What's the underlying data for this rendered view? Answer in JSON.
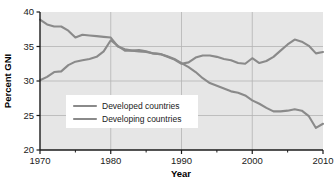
{
  "chart_data": {
    "type": "line",
    "title": "",
    "xlabel": "Year",
    "ylabel": "Percent GNI",
    "xlim": [
      1970,
      2010
    ],
    "ylim": [
      20,
      40
    ],
    "xticks": [
      1970,
      1980,
      1990,
      2000,
      2010
    ],
    "xtick_labels": [
      "1970",
      "1980",
      "1990",
      "2000",
      "2010"
    ],
    "xminor_ticks": [
      1975,
      1985,
      1995,
      2005
    ],
    "yticks": [
      20,
      25,
      30,
      35,
      40
    ],
    "ytick_labels": [
      "20",
      "25",
      "30",
      "35",
      "40"
    ],
    "grid": true,
    "grid_axis": "both",
    "legend_position": "center-left-inside",
    "plot_background": "#e6e6e6",
    "line_color": "#8a8a8a",
    "series": [
      {
        "name": "Developed countries",
        "color": "#8a8a8a",
        "x": [
          1970,
          1971,
          1972,
          1973,
          1974,
          1975,
          1976,
          1977,
          1978,
          1979,
          1980,
          1981,
          1982,
          1983,
          1984,
          1985,
          1986,
          1987,
          1988,
          1989,
          1990,
          1991,
          1992,
          1993,
          1994,
          1995,
          1996,
          1997,
          1998,
          1999,
          2000,
          2001,
          2002,
          2003,
          2004,
          2005,
          2006,
          2007,
          2008,
          2009,
          2010
        ],
        "values": [
          30.1,
          30.6,
          31.3,
          31.4,
          32.3,
          32.8,
          33.0,
          33.2,
          33.5,
          34.3,
          35.9,
          35.1,
          34.4,
          34.4,
          34.3,
          34.2,
          34.0,
          33.9,
          33.6,
          33.2,
          32.6,
          32.0,
          31.3,
          30.4,
          29.7,
          29.3,
          28.9,
          28.5,
          28.3,
          27.9,
          27.2,
          26.7,
          26.1,
          25.6,
          25.6,
          25.7,
          25.9,
          25.7,
          24.9,
          23.2,
          23.8
        ]
      },
      {
        "name": "Developing countries",
        "color": "#8a8a8a",
        "x": [
          1970,
          1971,
          1972,
          1973,
          1974,
          1975,
          1976,
          1977,
          1978,
          1979,
          1980,
          1981,
          1982,
          1983,
          1984,
          1985,
          1986,
          1987,
          1988,
          1989,
          1990,
          1991,
          1992,
          1993,
          1994,
          1995,
          1996,
          1997,
          1998,
          1999,
          2000,
          2001,
          2002,
          2003,
          2004,
          2005,
          2006,
          2007,
          2008,
          2009,
          2010
        ],
        "values": [
          38.9,
          38.2,
          37.9,
          37.9,
          37.3,
          36.3,
          36.7,
          36.6,
          36.5,
          36.4,
          36.3,
          35.0,
          34.6,
          34.4,
          34.5,
          34.3,
          34.0,
          33.9,
          33.5,
          33.1,
          32.5,
          32.7,
          33.4,
          33.7,
          33.7,
          33.5,
          33.2,
          33.0,
          32.6,
          32.5,
          33.3,
          32.6,
          32.9,
          33.5,
          34.4,
          35.3,
          36.0,
          35.7,
          35.1,
          34.0,
          34.2
        ]
      }
    ],
    "legend": [
      {
        "label": "Developed countries"
      },
      {
        "label": "Developing countries"
      }
    ]
  }
}
